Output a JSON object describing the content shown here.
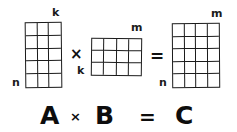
{
  "diagram": {
    "background_color": "#ffffff",
    "ink_color": "#1a1a1a",
    "matrices": [
      {
        "id": "A",
        "name": "matrix-a",
        "label": "A",
        "columns": 3,
        "rows": 5,
        "col_dim_label": "k",
        "row_dim_label": "n"
      },
      {
        "id": "B",
        "name": "matrix-b",
        "label": "B",
        "columns": 4,
        "rows": 3,
        "col_dim_label": "m",
        "row_dim_label": "k"
      },
      {
        "id": "C",
        "name": "matrix-c",
        "label": "C",
        "columns": 4,
        "rows": 5,
        "col_dim_label": "m",
        "row_dim_label": "n"
      }
    ],
    "top_operators": {
      "multiply": "×",
      "equals": "="
    },
    "equation": {
      "operand_left": "A",
      "multiply": "×",
      "operand_right": "B",
      "equals": "=",
      "result": "C"
    }
  }
}
